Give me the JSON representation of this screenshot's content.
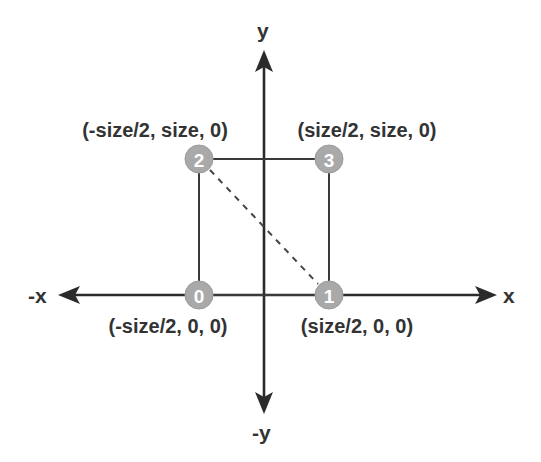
{
  "diagram": {
    "axes": {
      "x_pos_label": "x",
      "x_neg_label": "-x",
      "y_pos_label": "y",
      "y_neg_label": "-y"
    },
    "vertices": [
      {
        "index": "0",
        "label": "0",
        "coord": "(-size/2, 0, 0)"
      },
      {
        "index": "1",
        "label": "1",
        "coord": "(size/2, 0, 0)"
      },
      {
        "index": "2",
        "label": "2",
        "coord": "(-size/2, size, 0)"
      },
      {
        "index": "3",
        "label": "3",
        "coord": "(size/2, size, 0)"
      }
    ],
    "edges": [
      {
        "from": "0",
        "to": "1",
        "style": "solid"
      },
      {
        "from": "0",
        "to": "2",
        "style": "solid"
      },
      {
        "from": "2",
        "to": "3",
        "style": "solid"
      },
      {
        "from": "1",
        "to": "3",
        "style": "solid"
      },
      {
        "from": "2",
        "to": "1",
        "style": "dashed"
      }
    ],
    "colors": {
      "axis": "#2b2b2b",
      "vertex_fill": "#a9a9a9",
      "vertex_text": "#ffffff",
      "label_text": "#333333"
    }
  }
}
